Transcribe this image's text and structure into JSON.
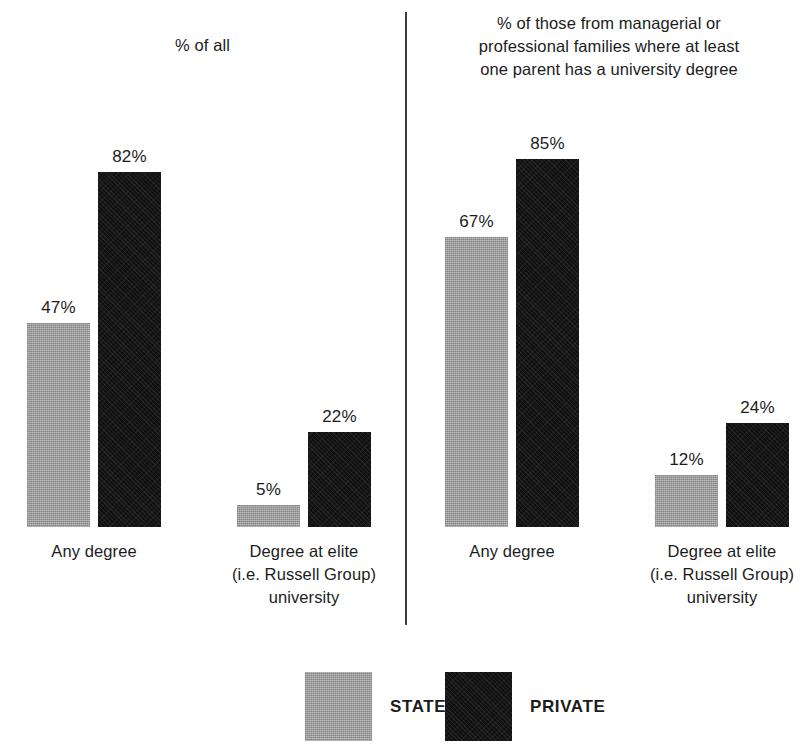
{
  "chart_data": {
    "type": "bar",
    "title": "",
    "xlabel": "",
    "ylabel": "",
    "ylim": [
      0,
      100
    ],
    "grid": false,
    "legend_position": "bottom-center",
    "legend": [
      {
        "name": "STATE",
        "color": "#9c9c9c"
      },
      {
        "name": "PRIVATE",
        "color": "#121212"
      }
    ],
    "categories": [
      "Any degree",
      "Degree at elite\n(i.e. Russell Group)\nuniversity"
    ],
    "panels": [
      {
        "title": "% of all",
        "series": [
          {
            "name": "STATE",
            "values": [
              47,
              5
            ]
          },
          {
            "name": "PRIVATE",
            "values": [
              82,
              22
            ]
          }
        ]
      },
      {
        "title": "% of those from managerial or\nprofessional families where at least\none parent has a university degree",
        "series": [
          {
            "name": "STATE",
            "values": [
              67,
              12
            ]
          },
          {
            "name": "PRIVATE",
            "values": [
              85,
              24
            ]
          }
        ]
      }
    ],
    "value_labels": [
      "47%",
      "82%",
      "5%",
      "22%",
      "67%",
      "85%",
      "12%",
      "24%"
    ]
  },
  "panels": {
    "left": {
      "title": "% of all",
      "groups": [
        {
          "label": "Any degree",
          "state": {
            "label": "47%",
            "value": 47
          },
          "private": {
            "label": "82%",
            "value": 82
          }
        },
        {
          "label": "Degree at elite\n(i.e. Russell Group)\nuniversity",
          "state": {
            "label": "5%",
            "value": 5
          },
          "private": {
            "label": "22%",
            "value": 22
          }
        }
      ]
    },
    "right": {
      "title": "% of those from managerial or\nprofessional families where at least\none parent has a university degree",
      "groups": [
        {
          "label": "Any degree",
          "state": {
            "label": "67%",
            "value": 67
          },
          "private": {
            "label": "85%",
            "value": 85
          }
        },
        {
          "label": "Degree at elite\n(i.e. Russell Group)\nuniversity",
          "state": {
            "label": "12%",
            "value": 12
          },
          "private": {
            "label": "24%",
            "value": 24
          }
        }
      ]
    }
  },
  "legend": {
    "state_label": "STATE",
    "private_label": "PRIVATE"
  },
  "colors": {
    "state": "#9c9c9c",
    "private": "#121212",
    "divider": "#3b3b3b",
    "text": "#1c1c1c",
    "background": "#ffffff"
  }
}
